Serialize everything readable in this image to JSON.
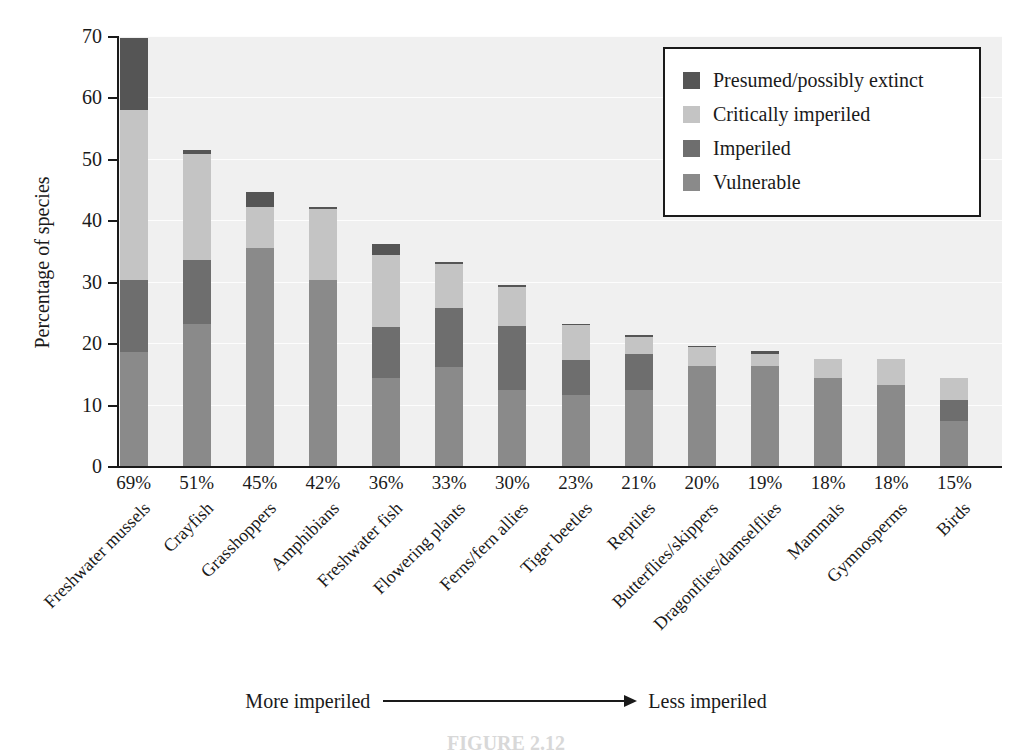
{
  "chart_data": {
    "type": "bar",
    "subtype": "stacked-bar",
    "title": "",
    "xlabel": "",
    "ylabel": "Percentage of species",
    "ylim": [
      0,
      70
    ],
    "yticks": [
      0,
      10,
      20,
      30,
      40,
      50,
      60,
      70
    ],
    "grid": true,
    "legend_position": "top-right",
    "categories": [
      "Freshwater mussels",
      "Crayfish",
      "Grasshoppers",
      "Amphibians",
      "Freshwater fish",
      "Flowering plants",
      "Ferns/fern allies",
      "Tiger beetles",
      "Reptiles",
      "Butterflies/skippers",
      "Dragonflies/damselflies",
      "Mammals",
      "Gymnosperms",
      "Birds"
    ],
    "category_totals_labels": [
      "69%",
      "51%",
      "45%",
      "42%",
      "36%",
      "33%",
      "30%",
      "23%",
      "21%",
      "20%",
      "19%",
      "18%",
      "18%",
      "15%"
    ],
    "series": [
      {
        "name": "Vulnerable",
        "color": "#8a8a8a",
        "values": [
          18.5,
          23.2,
          35.5,
          30.3,
          14.4,
          16.2,
          12.3,
          11.6,
          12.3,
          16.3,
          16.3,
          14.4,
          13.2,
          7.3
        ]
      },
      {
        "name": "Imperiled",
        "color": "#6e6e6e",
        "values": [
          11.8,
          10.3,
          0.0,
          0.0,
          8.2,
          9.6,
          10.5,
          5.7,
          6.0,
          0.0,
          0.0,
          0.0,
          0.0,
          3.5
        ]
      },
      {
        "name": "Critically imperiled",
        "color": "#c4c4c4",
        "values": [
          27.7,
          17.3,
          6.7,
          11.5,
          11.8,
          7.1,
          6.3,
          5.6,
          2.7,
          3.0,
          2.0,
          3.1,
          4.2,
          3.6
        ]
      },
      {
        "name": "Presumed/possibly extinct",
        "color": "#555555",
        "values": [
          11.7,
          0.6,
          2.4,
          0.4,
          1.8,
          0.3,
          0.4,
          0.3,
          0.3,
          0.2,
          0.5,
          0.0,
          0.0,
          0.0
        ]
      }
    ],
    "stack_order_bottom_to_top": [
      "Vulnerable",
      "Imperiled",
      "Critically imperiled",
      "Presumed/possibly extinct"
    ],
    "bar_totals": [
      69.7,
      51.4,
      44.6,
      42.2,
      36.2,
      33.2,
      29.5,
      23.2,
      21.3,
      19.5,
      18.8,
      17.5,
      17.4,
      14.4
    ],
    "annotations": {
      "left_text": "More imperiled",
      "right_text": "Less imperiled",
      "arrow": "rightwards-arrow"
    }
  },
  "legend": {
    "items": [
      {
        "label": "Presumed/possibly extinct",
        "color": "#555555"
      },
      {
        "label": "Critically imperiled",
        "color": "#c4c4c4"
      },
      {
        "label": "Imperiled",
        "color": "#6e6e6e"
      },
      {
        "label": "Vulnerable",
        "color": "#8a8a8a"
      }
    ]
  },
  "axes": {
    "y_title": "Percentage of species",
    "y_tick_labels": [
      "0",
      "10",
      "20",
      "30",
      "40",
      "50",
      "60",
      "70"
    ]
  },
  "caption": {
    "text": "FIGURE 2.12"
  },
  "colors": {
    "plot_background": "#f0f0f0",
    "page_background": "#ffffff",
    "axis": "#1a1a1a",
    "gridline": "#ffffff"
  }
}
